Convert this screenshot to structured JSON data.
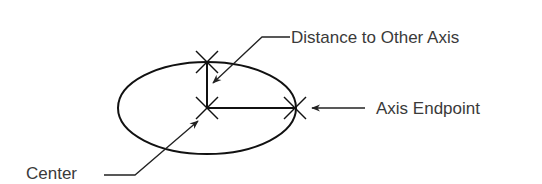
{
  "diagram": {
    "labels": {
      "distance": "Distance to Other Axis",
      "endpoint": "Axis Endpoint",
      "center": "Center"
    },
    "colors": {
      "stroke": "#111111",
      "text": "#3a3a3a",
      "background": "#ffffff"
    }
  }
}
